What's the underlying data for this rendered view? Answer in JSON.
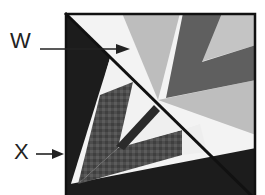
{
  "diagram": {
    "type": "quilt-block",
    "labels": [
      {
        "id": "W",
        "text": "W",
        "target": "light wedge in upper-right triangle"
      },
      {
        "id": "X",
        "text": "X",
        "target": "dark triangle along left edge"
      }
    ]
  },
  "colors": {
    "border": "#111111",
    "black_fabric": "#1a1a1a",
    "dark_gray": "#5a5a5a",
    "mottled_gray": "#4a4a4a",
    "light_gray": "#b8b8b8",
    "pale": "#f2f2f2"
  }
}
